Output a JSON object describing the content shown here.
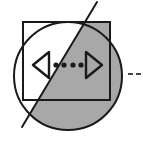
{
  "figure": {
    "canvas": {
      "width": 143,
      "height": 141,
      "background": "#ffffff"
    },
    "colors": {
      "gray_fill": "#a8a8a8",
      "white_fill": "#ffffff",
      "stroke": "#1a1a1a"
    },
    "shapes": {
      "circle": {
        "name": "circle",
        "cx": 68,
        "cy": 76,
        "r": 54,
        "stroke_width": 2
      },
      "square": {
        "name": "square",
        "x": 23,
        "y": 22,
        "width": 87,
        "height": 78,
        "stroke_width": 2
      },
      "diagonal_line": {
        "name": "diagonal-line",
        "x1": 97,
        "y1": 2,
        "x2": 22,
        "y2": 127,
        "stroke_width": 2
      }
    },
    "glyphs": {
      "left_triangle": {
        "name": "left-pointing-triangle",
        "direction": "left",
        "cx": 41,
        "cy": 65,
        "half_height": 13,
        "width": 16
      },
      "right_triangle": {
        "name": "right-pointing-triangle",
        "direction": "right",
        "cx": 94,
        "cy": 65,
        "half_height": 13,
        "width": 16
      },
      "dots": {
        "name": "ellipsis-dots",
        "count": 4,
        "radius": 2.6,
        "cy": 65,
        "positions_x": [
          56,
          64,
          73,
          81
        ]
      }
    },
    "side_marks": {
      "name": "right-side-dashes",
      "count": 2,
      "cy": 74,
      "width": 5,
      "height": 1.6,
      "positions_x": [
        128,
        136
      ]
    }
  }
}
